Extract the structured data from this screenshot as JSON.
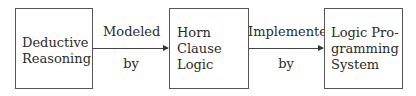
{
  "diagram": {
    "nodes": [
      {
        "id": "deductive-reasoning",
        "label": "Deductive\nReasoning"
      },
      {
        "id": "horn-clause-logic",
        "label": "Horn\nClause\nLogic"
      },
      {
        "id": "logic-programming-system",
        "label": "Logic Pro-\ngramming\nSystem"
      }
    ],
    "edges": [
      {
        "from": "deductive-reasoning",
        "to": "horn-clause-logic",
        "label_top": "Modeled",
        "label_bottom": "by"
      },
      {
        "from": "horn-clause-logic",
        "to": "logic-programming-system",
        "label_top": "Implemented",
        "label_bottom": "by"
      }
    ]
  }
}
